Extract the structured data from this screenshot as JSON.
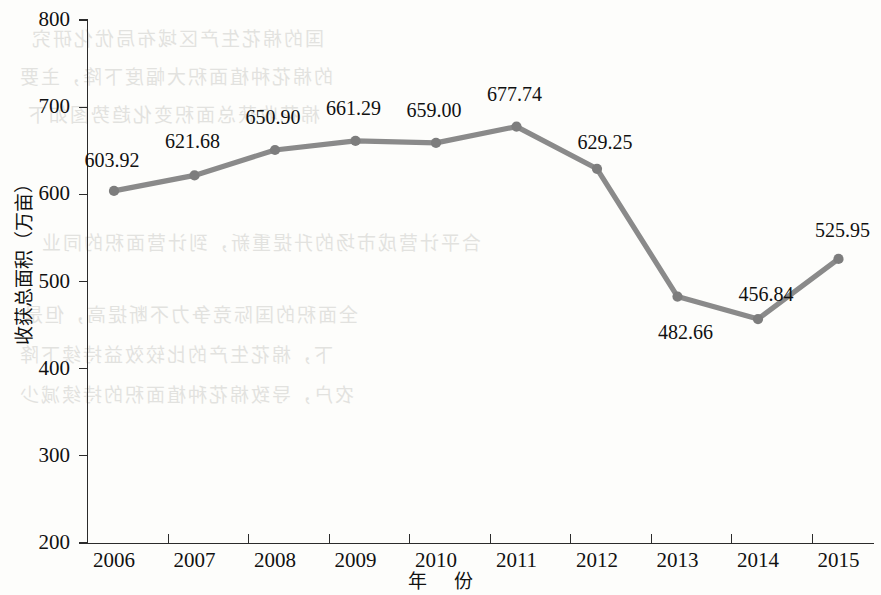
{
  "chart_data": {
    "type": "line",
    "title": "",
    "xlabel": "年 份",
    "ylabel": "收获总面积（万亩）",
    "categories": [
      "2006",
      "2007",
      "2008",
      "2009",
      "2010",
      "2011",
      "2012",
      "2013",
      "2014",
      "2015"
    ],
    "values": [
      603.92,
      621.68,
      650.9,
      661.29,
      659.0,
      677.74,
      629.25,
      482.66,
      456.84,
      525.95
    ],
    "point_labels": [
      "603.92",
      "621.68",
      "650.90",
      "661.29",
      "659.00",
      "677.74",
      "629.25",
      "482.66",
      "456.84",
      "525.95"
    ],
    "ylim": [
      200,
      800
    ],
    "yticks": [
      200,
      300,
      400,
      500,
      600,
      700,
      800
    ],
    "ytick_labels": [
      "200",
      "300",
      "400",
      "500",
      "600",
      "700",
      "800"
    ],
    "grid": false,
    "legend": null,
    "series": [
      {
        "name": "收获总面积",
        "values": [
          603.92,
          621.68,
          650.9,
          661.29,
          659.0,
          677.74,
          629.25,
          482.66,
          456.84,
          525.95
        ],
        "color": "#8a8a8a",
        "marker": "circle"
      }
    ],
    "line_color": "#8a8a8a",
    "marker_color": "#7d7d7d"
  },
  "figure": {
    "background_color": "#fdfdfb",
    "axis_color": "#2b2b2b",
    "text_color": "#111111"
  },
  "watermark": {
    "note": "faint mirrored show-through text from reverse side of scanned page",
    "lines": [
      "国的棉花生产区域布局优化研究",
      "的棉花种植面积大幅度下降，主要",
      "棉花收获总面积变化趋势图如下",
      "合平计营成市场的升提重新，到计营面积的同业",
      "全面积的国际竞争力不断提高，但是",
      "下，棉花生产的比较效益持续下降",
      "农户，导致棉花种植面积的持续减少"
    ]
  }
}
